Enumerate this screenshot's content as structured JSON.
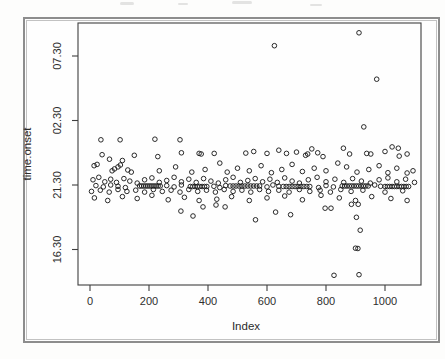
{
  "figure": {
    "caption": "",
    "frame_color": "#8d8d8d",
    "background": "#fefefe"
  },
  "chart_data": {
    "type": "scatter",
    "title": "",
    "xlabel": "Index",
    "ylabel": "time.onset",
    "marker": "open-circle",
    "point_color": "#1f1f1f",
    "grid": "off",
    "legend": "none",
    "x_ticks": [
      0,
      200,
      400,
      600,
      800,
      1000
    ],
    "y_ticks": [
      {
        "value": 16.5,
        "label": "16.30"
      },
      {
        "value": 21.5,
        "label": "21.30"
      },
      {
        "value": 26.5,
        "label": "02.30"
      },
      {
        "value": 31.5,
        "label": "07.30"
      }
    ],
    "xlim": [
      -45,
      1120
    ],
    "ylim": [
      13.8,
      34.05
    ],
    "y_unit_note": "onset time as hours on a 24h clock; values above 24 are times after midnight (26.5 = 02:30, 31.5 = 07:30)",
    "points": {
      "x": [
        625,
        912,
        972,
        928,
        37,
        102,
        220,
        305,
        1024,
        41,
        66,
        150,
        230,
        310,
        370,
        377,
        421,
        528,
        555,
        600,
        640,
        666,
        700,
        731,
        738,
        752,
        772,
        790,
        859,
        880,
        938,
        952,
        1000,
        1045,
        1048,
        1075,
        14,
        24,
        75,
        83,
        95,
        103,
        110,
        128,
        140,
        235,
        290,
        345,
        390,
        440,
        465,
        500,
        540,
        580,
        615,
        650,
        685,
        720,
        760,
        800,
        840,
        870,
        905,
        945,
        980,
        1010,
        1040,
        1075,
        1095,
        10,
        30,
        50,
        70,
        90,
        115,
        135,
        160,
        185,
        210,
        235,
        260,
        285,
        310,
        335,
        360,
        385,
        410,
        435,
        460,
        485,
        510,
        535,
        560,
        585,
        610,
        635,
        660,
        685,
        710,
        740,
        770,
        800,
        830,
        860,
        890,
        920,
        950,
        980,
        1010,
        1040,
        1070,
        1100,
        168,
        175,
        182,
        189,
        196,
        203,
        210,
        217,
        224,
        231,
        238,
        340,
        348,
        356,
        364,
        372,
        380,
        388,
        396,
        475,
        485,
        495,
        505,
        515,
        525,
        535,
        545,
        555,
        565,
        575,
        655,
        665,
        675,
        685,
        695,
        705,
        715,
        725,
        735,
        745,
        855,
        863,
        871,
        879,
        887,
        895,
        903,
        911,
        919,
        927,
        935,
        943,
        1000,
        1008,
        1016,
        1024,
        1032,
        1040,
        1048,
        1056,
        1064,
        1072,
        1080,
        20,
        45,
        70,
        95,
        120,
        260,
        285,
        310,
        420,
        440,
        460,
        600,
        620,
        640,
        775,
        800,
        825,
        965,
        985,
        5,
        35,
        65,
        95,
        125,
        155,
        185,
        215,
        245,
        275,
        305,
        335,
        365,
        395,
        425,
        455,
        485,
        515,
        545,
        575,
        605,
        640,
        675,
        710,
        745,
        780,
        815,
        850,
        885,
        925,
        1000,
        1060,
        15,
        60,
        110,
        160,
        210,
        265,
        320,
        370,
        430,
        480,
        540,
        600,
        660,
        720,
        783,
        845,
        900,
        955,
        1020,
        1075,
        308,
        349,
        383,
        427,
        458,
        561,
        629,
        680,
        797,
        817,
        886,
        909,
        903,
        916,
        900,
        908,
        827,
        912
      ],
      "y": [
        32.3,
        33.3,
        29.7,
        26.0,
        25.0,
        25.0,
        25.05,
        25.0,
        24.45,
        23.85,
        23.5,
        23.8,
        23.7,
        24.0,
        23.95,
        23.9,
        23.95,
        23.97,
        24.1,
        23.95,
        24.2,
        23.95,
        24.05,
        23.8,
        23.9,
        24.3,
        24.0,
        23.7,
        24.35,
        23.9,
        23.95,
        23.9,
        24.1,
        24.35,
        23.74,
        23.9,
        23.0,
        23.1,
        22.6,
        22.75,
        22.9,
        23.05,
        23.4,
        22.66,
        22.5,
        22.6,
        22.9,
        22.5,
        22.7,
        23.2,
        22.5,
        22.8,
        22.6,
        23.0,
        22.45,
        22.7,
        23.1,
        22.55,
        22.8,
        22.6,
        23.2,
        22.9,
        22.5,
        22.7,
        23.0,
        22.45,
        22.8,
        22.43,
        22.6,
        21.9,
        22.1,
        21.75,
        21.95,
        21.7,
        22.0,
        21.8,
        21.65,
        21.9,
        22.05,
        21.7,
        21.85,
        22.1,
        21.75,
        21.95,
        21.7,
        22.0,
        21.8,
        21.65,
        21.9,
        22.1,
        21.7,
        21.85,
        22.0,
        21.75,
        21.95,
        21.7,
        22.05,
        21.8,
        21.65,
        21.9,
        22.1,
        21.75,
        21.95,
        21.7,
        22.0,
        21.8,
        21.65,
        21.9,
        22.05,
        21.75,
        21.95,
        21.7,
        21.42,
        21.42,
        21.42,
        21.42,
        21.42,
        21.42,
        21.42,
        21.42,
        21.42,
        21.42,
        21.42,
        21.38,
        21.38,
        21.38,
        21.38,
        21.38,
        21.38,
        21.38,
        21.38,
        21.42,
        21.42,
        21.42,
        21.42,
        21.42,
        21.42,
        21.42,
        21.42,
        21.42,
        21.42,
        21.42,
        21.38,
        21.38,
        21.38,
        21.38,
        21.38,
        21.38,
        21.38,
        21.38,
        21.38,
        21.38,
        21.42,
        21.42,
        21.42,
        21.42,
        21.42,
        21.42,
        21.42,
        21.42,
        21.42,
        21.42,
        21.42,
        21.42,
        21.38,
        21.38,
        21.38,
        21.38,
        21.38,
        21.38,
        21.38,
        21.38,
        21.38,
        21.38,
        21.38,
        21.45,
        21.35,
        21.5,
        21.4,
        21.3,
        21.45,
        21.35,
        21.5,
        21.4,
        21.3,
        21.45,
        21.35,
        21.5,
        21.4,
        21.3,
        21.45,
        21.35,
        21.5,
        21.4,
        21.0,
        21.1,
        20.95,
        21.15,
        21.0,
        21.1,
        20.95,
        21.15,
        21.0,
        21.1,
        20.95,
        21.15,
        21.0,
        21.1,
        20.95,
        21.15,
        21.0,
        21.1,
        20.95,
        21.15,
        21.0,
        21.1,
        20.95,
        21.15,
        21.0,
        21.1,
        20.95,
        21.15,
        21.0,
        21.1,
        20.95,
        21.05,
        20.5,
        20.3,
        20.6,
        20.45,
        20.7,
        20.35,
        20.55,
        20.3,
        20.4,
        20.6,
        20.3,
        20.5,
        20.65,
        20.35,
        20.7,
        20.5,
        20.3,
        20.6,
        20.45,
        20.3,
        19.48,
        19.1,
        19.8,
        19.95,
        19.8,
        18.8,
        19.4,
        19.2,
        19.7,
        19.7,
        20.0,
        20.0,
        19.0,
        18.0,
        16.6,
        16.58,
        14.5,
        14.55
      ]
    }
  }
}
